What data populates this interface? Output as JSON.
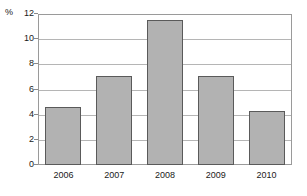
{
  "chart_data": {
    "type": "bar",
    "title": "",
    "xlabel": "",
    "ylabel": "%",
    "categories": [
      "2006",
      "2007",
      "2008",
      "2009",
      "2010"
    ],
    "values": [
      4.6,
      7.1,
      11.5,
      7.1,
      4.3
    ],
    "ylim": [
      0,
      12
    ],
    "yticks": [
      0,
      2,
      4,
      6,
      8,
      10,
      12
    ],
    "ytick_labels": [
      "0",
      "2",
      "4",
      "6",
      "8",
      "10",
      "12"
    ],
    "grid": true,
    "grid_axis": "y",
    "legend": false,
    "legend_position": "none",
    "bar_color": "#b2b2b2",
    "bar_edge_color": "#5a5a5a",
    "grid_color": "#b5b5b5",
    "frame_color": "#9a9a9a",
    "text_color": "#1a1a1a",
    "background": "#ffffff"
  }
}
